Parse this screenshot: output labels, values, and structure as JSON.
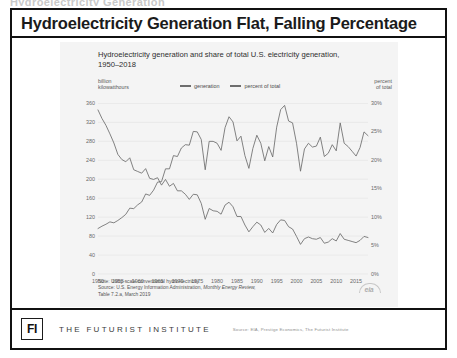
{
  "clipped_top_text": "Hydroelectricity Generation",
  "slide": {
    "title": "Hydroelectricity Generation Flat, Falling Percentage"
  },
  "footer": {
    "logo_text": "FI",
    "brand": "THE FUTURIST INSTITUTE",
    "source": "Source:  EIA, Prestige Economics, The Futurist Institute"
  },
  "chart_note": {
    "line1": "Note: Utility-scale conventional hydroelectricity.",
    "line2_prefix": "Source: U.S. Energy Information Administration, ",
    "line2_italic": "Monthly Energy Review,",
    "line3": "Table 7.2.a, March 2019"
  },
  "eia_logo_label": "eia",
  "chart_data": {
    "type": "line",
    "title": "Hydroelectricity generation and share of total U.S. electricity generation, 1950–2018",
    "xlabel": "",
    "ylabel": "billion kilowatthours",
    "y2label": "percent of total",
    "ylim": [
      0,
      380
    ],
    "y2lim": [
      0,
      31.6
    ],
    "yticks": [
      "0",
      "40",
      "80",
      "120",
      "160",
      "200",
      "240",
      "280",
      "320",
      "360"
    ],
    "ytick_values": [
      0,
      40,
      80,
      120,
      160,
      200,
      240,
      280,
      320,
      360
    ],
    "y2ticks": [
      "0%",
      "5%",
      "10%",
      "15%",
      "20%",
      "25%",
      "30%"
    ],
    "y2tick_values": [
      0,
      5,
      10,
      15,
      20,
      25,
      30
    ],
    "xticks": [
      "1950",
      "1955",
      "1960",
      "1965",
      "1970",
      "1975",
      "1980",
      "1985",
      "1990",
      "1995",
      "2000",
      "2005",
      "2010",
      "2015"
    ],
    "xtick_values": [
      1950,
      1955,
      1960,
      1965,
      1970,
      1975,
      1980,
      1985,
      1990,
      1995,
      2000,
      2005,
      2010,
      2015
    ],
    "xlim": [
      1950,
      2018
    ],
    "grid": true,
    "legend_position": "top",
    "legend": [
      "generation",
      "percent of total"
    ],
    "line_color": "#6d6d6d",
    "series": [
      {
        "name": "generation",
        "axis": "left",
        "unit": "billion kilowatthours",
        "x": [
          1950,
          1951,
          1952,
          1953,
          1954,
          1955,
          1956,
          1957,
          1958,
          1959,
          1960,
          1961,
          1962,
          1963,
          1964,
          1965,
          1966,
          1967,
          1968,
          1969,
          1970,
          1971,
          1972,
          1973,
          1974,
          1975,
          1976,
          1977,
          1978,
          1979,
          1980,
          1981,
          1982,
          1983,
          1984,
          1985,
          1986,
          1987,
          1988,
          1989,
          1990,
          1991,
          1992,
          1993,
          1994,
          1995,
          1996,
          1997,
          1998,
          1999,
          2000,
          2001,
          2002,
          2003,
          2004,
          2005,
          2006,
          2007,
          2008,
          2009,
          2010,
          2011,
          2012,
          2013,
          2014,
          2015,
          2016,
          2017,
          2018
        ],
        "values": [
          96,
          101,
          105,
          110,
          108,
          113,
          119,
          126,
          139,
          138,
          146,
          152,
          169,
          166,
          177,
          194,
          195,
          222,
          222,
          250,
          248,
          266,
          273,
          272,
          301,
          300,
          284,
          220,
          280,
          280,
          276,
          261,
          309,
          332,
          321,
          281,
          291,
          250,
          223,
          265,
          293,
          276,
          239,
          269,
          247,
          310,
          347,
          356,
          323,
          319,
          276,
          217,
          264,
          276,
          268,
          270,
          289,
          248,
          255,
          273,
          260,
          319,
          276,
          269,
          259,
          249,
          267,
          300,
          292
        ]
      },
      {
        "name": "percent of total",
        "axis": "right",
        "unit": "percent",
        "x": [
          1950,
          1951,
          1952,
          1953,
          1954,
          1955,
          1956,
          1957,
          1958,
          1959,
          1960,
          1961,
          1962,
          1963,
          1964,
          1965,
          1966,
          1967,
          1968,
          1969,
          1970,
          1971,
          1972,
          1973,
          1974,
          1975,
          1976,
          1977,
          1978,
          1979,
          1980,
          1981,
          1982,
          1983,
          1984,
          1985,
          1986,
          1987,
          1988,
          1989,
          1990,
          1991,
          1992,
          1993,
          1994,
          1995,
          1996,
          1997,
          1998,
          1999,
          2000,
          2001,
          2002,
          2003,
          2004,
          2005,
          2006,
          2007,
          2008,
          2009,
          2010,
          2011,
          2012,
          2013,
          2014,
          2015,
          2016,
          2017,
          2018
        ],
        "values": [
          28.8,
          27.3,
          26.1,
          24.6,
          23.0,
          21.0,
          20.1,
          19.7,
          20.4,
          18.3,
          18.0,
          17.7,
          18.5,
          16.8,
          16.6,
          16.9,
          15.6,
          16.6,
          15.4,
          15.9,
          14.6,
          14.6,
          14.0,
          13.1,
          14.0,
          13.9,
          12.4,
          9.6,
          11.5,
          11.1,
          11.0,
          10.5,
          12.1,
          12.6,
          11.8,
          10.1,
          10.1,
          8.6,
          7.4,
          8.3,
          9.1,
          8.6,
          7.3,
          8.0,
          7.2,
          8.7,
          9.5,
          9.4,
          8.3,
          7.9,
          6.6,
          5.2,
          6.2,
          6.5,
          6.2,
          6.1,
          6.4,
          5.4,
          5.6,
          6.2,
          5.8,
          7.1,
          6.1,
          5.9,
          5.7,
          5.5,
          5.9,
          6.6,
          6.4
        ]
      }
    ]
  }
}
